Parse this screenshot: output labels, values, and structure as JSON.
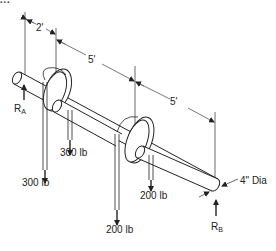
{
  "figure": {
    "cutoff_header": "...",
    "dimensions": {
      "span_1": "2'",
      "span_2": "5'",
      "span_3": "5'",
      "shaft_diameter": "4\" Dia"
    },
    "reactions": {
      "left": "R",
      "left_sub": "A",
      "right": "R",
      "right_sub": "B"
    },
    "loads": {
      "pulley_1_left": "300 lb",
      "pulley_1_right": "300 lb",
      "pulley_2_left": "200 lb",
      "pulley_2_right": "200 lb"
    },
    "colors": {
      "line": "#222222",
      "dim_line": "#555555",
      "background": "#ffffff"
    }
  }
}
